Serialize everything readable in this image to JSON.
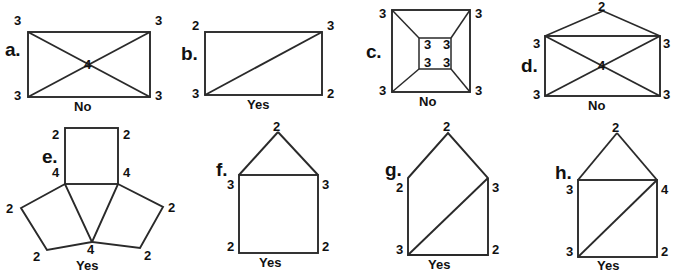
{
  "page": {
    "background": "#ffffff",
    "stroke_color": "#2a2a2a",
    "text_color": "#111111",
    "width": 675,
    "height": 274
  },
  "figures": [
    {
      "id": "a",
      "letter": "a.",
      "shape": "rectangle-with-x-diagonals",
      "verdict": "No",
      "degree_labels": [
        {
          "value": "3",
          "position": "top-left"
        },
        {
          "value": "3",
          "position": "top-right"
        },
        {
          "value": "4",
          "position": "center"
        },
        {
          "value": "3",
          "position": "bottom-left"
        },
        {
          "value": "3",
          "position": "bottom-right"
        }
      ]
    },
    {
      "id": "b",
      "letter": "b.",
      "shape": "rectangle-with-one-diagonal",
      "verdict": "Yes",
      "degree_labels": [
        {
          "value": "2",
          "position": "top-left"
        },
        {
          "value": "3",
          "position": "top-right"
        },
        {
          "value": "3",
          "position": "bottom-left"
        },
        {
          "value": "2",
          "position": "bottom-right"
        }
      ]
    },
    {
      "id": "c",
      "letter": "c.",
      "shape": "square-in-square-with-corner-connectors",
      "verdict": "No",
      "degree_labels": [
        {
          "value": "3",
          "position": "outer-top-left"
        },
        {
          "value": "3",
          "position": "outer-top-right"
        },
        {
          "value": "3",
          "position": "inner-top-left"
        },
        {
          "value": "3",
          "position": "inner-top-right"
        },
        {
          "value": "3",
          "position": "inner-bottom-left"
        },
        {
          "value": "3",
          "position": "inner-bottom-right"
        },
        {
          "value": "3",
          "position": "outer-bottom-left"
        },
        {
          "value": "3",
          "position": "outer-bottom-right"
        }
      ]
    },
    {
      "id": "d",
      "letter": "d.",
      "shape": "envelope-rectangle-with-x-and-flap",
      "verdict": "No",
      "degree_labels": [
        {
          "value": "2",
          "position": "apex"
        },
        {
          "value": "3",
          "position": "top-left"
        },
        {
          "value": "3",
          "position": "top-right"
        },
        {
          "value": "4",
          "position": "center"
        },
        {
          "value": "3",
          "position": "bottom-left"
        },
        {
          "value": "3",
          "position": "bottom-right"
        }
      ]
    },
    {
      "id": "e",
      "letter": "e.",
      "shape": "three-squares-pinwheel",
      "verdict": "Yes",
      "degree_labels": [
        {
          "value": "2",
          "position": "top-square-top-left"
        },
        {
          "value": "2",
          "position": "top-square-top-right"
        },
        {
          "value": "4",
          "position": "top-square-bottom-left"
        },
        {
          "value": "4",
          "position": "top-square-bottom-right"
        },
        {
          "value": "2",
          "position": "left-square-left"
        },
        {
          "value": "2",
          "position": "left-square-bottom"
        },
        {
          "value": "4",
          "position": "center-junction"
        },
        {
          "value": "2",
          "position": "right-square-bottom"
        },
        {
          "value": "2",
          "position": "right-square-right"
        }
      ]
    },
    {
      "id": "f",
      "letter": "f.",
      "shape": "house-square-with-roof",
      "verdict": "Yes",
      "degree_labels": [
        {
          "value": "2",
          "position": "apex"
        },
        {
          "value": "3",
          "position": "top-left"
        },
        {
          "value": "3",
          "position": "top-right"
        },
        {
          "value": "2",
          "position": "bottom-left"
        },
        {
          "value": "2",
          "position": "bottom-right"
        }
      ]
    },
    {
      "id": "g",
      "letter": "g.",
      "shape": "pentagon-house-with-diagonal",
      "verdict": "Yes",
      "degree_labels": [
        {
          "value": "2",
          "position": "apex"
        },
        {
          "value": "2",
          "position": "top-left"
        },
        {
          "value": "3",
          "position": "top-right"
        },
        {
          "value": "3",
          "position": "bottom-left"
        },
        {
          "value": "2",
          "position": "bottom-right"
        }
      ]
    },
    {
      "id": "h",
      "letter": "h.",
      "shape": "house-square-with-roof-and-diagonal",
      "verdict": "Yes",
      "degree_labels": [
        {
          "value": "2",
          "position": "apex"
        },
        {
          "value": "3",
          "position": "top-left"
        },
        {
          "value": "4",
          "position": "top-right"
        },
        {
          "value": "3",
          "position": "bottom-left"
        },
        {
          "value": "2",
          "position": "bottom-right"
        }
      ]
    }
  ]
}
